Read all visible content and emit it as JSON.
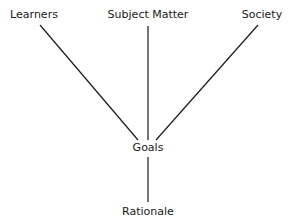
{
  "diagram": {
    "nodes": {
      "learners": "Learners",
      "subject_matter": "Subject Matter",
      "society": "Society",
      "goals": "Goals",
      "rationale": "Rationale"
    },
    "edges": [
      {
        "from": "Learners",
        "to": "Goals"
      },
      {
        "from": "Subject Matter",
        "to": "Goals"
      },
      {
        "from": "Society",
        "to": "Goals"
      },
      {
        "from": "Goals",
        "to": "Rationale"
      }
    ]
  }
}
